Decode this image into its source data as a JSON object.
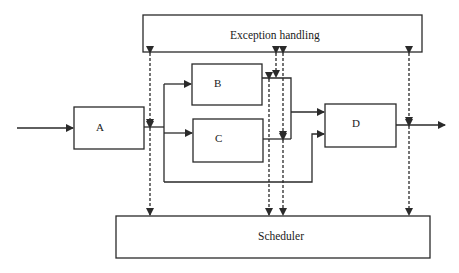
{
  "diagram": {
    "blocks": {
      "exception": {
        "label": "Exception handling"
      },
      "scheduler": {
        "label": "Scheduler"
      },
      "a": {
        "label": "A"
      },
      "b": {
        "label": "B"
      },
      "c": {
        "label": "C"
      },
      "d": {
        "label": "D"
      }
    },
    "edges": [
      {
        "from": "input",
        "to": "A",
        "style": "solid"
      },
      {
        "from": "A",
        "to": "B",
        "style": "solid"
      },
      {
        "from": "A",
        "to": "C",
        "style": "solid"
      },
      {
        "from": "A",
        "to": "D",
        "style": "solid",
        "note": "bypass path"
      },
      {
        "from": "B",
        "to": "D",
        "style": "solid"
      },
      {
        "from": "C",
        "to": "D",
        "style": "solid"
      },
      {
        "from": "D",
        "to": "output",
        "style": "solid"
      },
      {
        "from": "Exception handling",
        "to": "A output",
        "style": "dashed",
        "direction": "bidirectional"
      },
      {
        "from": "A output",
        "to": "Scheduler",
        "style": "dashed",
        "direction": "bidirectional"
      },
      {
        "from": "Exception handling",
        "to": "B/C output",
        "style": "dashed",
        "direction": "bidirectional"
      },
      {
        "from": "B/C output",
        "to": "Scheduler",
        "style": "dashed",
        "direction": "bidirectional"
      },
      {
        "from": "Exception handling",
        "to": "D output",
        "style": "dashed",
        "direction": "bidirectional"
      },
      {
        "from": "D output",
        "to": "Scheduler",
        "style": "dashed",
        "direction": "bidirectional"
      }
    ],
    "colors": {
      "stroke": "#2a2a2a",
      "background": "#ffffff"
    }
  }
}
